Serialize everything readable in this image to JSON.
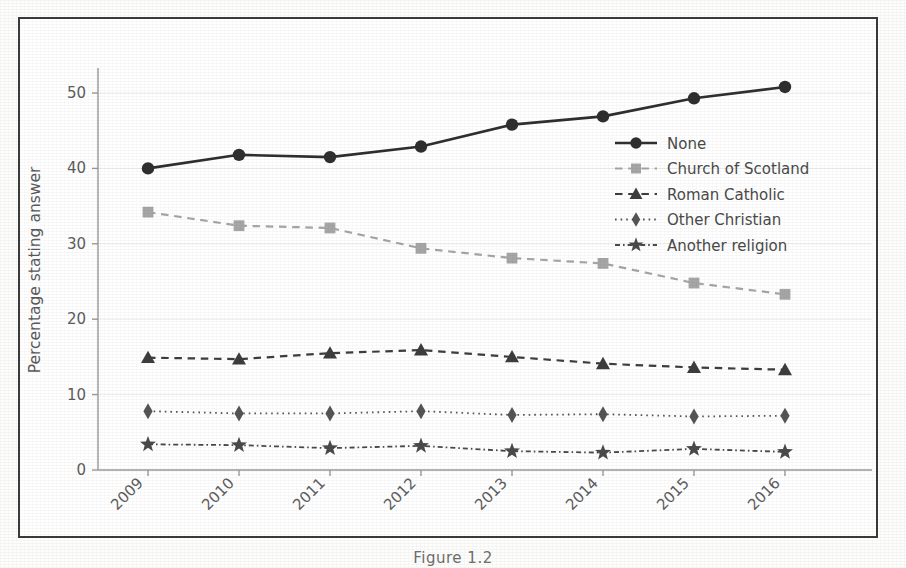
{
  "figure": {
    "caption": "Figure 1.2",
    "frame_color": "#3b3b3b",
    "background": "#ffffff"
  },
  "chart_data": {
    "type": "line",
    "title": "",
    "subtitle": "",
    "xlabel": "",
    "ylabel": "Percentage stating answer",
    "categories": [
      "2009",
      "2010",
      "2011",
      "2012",
      "2013",
      "2014",
      "2015",
      "2016"
    ],
    "x_tick_labels": [
      "2009",
      "2010",
      "2011",
      "2012",
      "2013",
      "2014",
      "2015",
      "2016"
    ],
    "x_tick_rotation": 45,
    "y_tick_labels": [
      "0",
      "10",
      "20",
      "30",
      "40",
      "50"
    ],
    "y_ticks": [
      0,
      10,
      20,
      30,
      40,
      50
    ],
    "ylim": [
      0,
      54
    ],
    "grid": "horizontal",
    "legend_position": "center-right",
    "series": [
      {
        "name": "None",
        "values": [
          40.0,
          41.8,
          41.5,
          42.9,
          45.8,
          46.9,
          49.3,
          50.8
        ],
        "color": "#2f2f2f",
        "marker": "circle",
        "linestyle": "solid",
        "linewidth": 2.6
      },
      {
        "name": "Church of Scotland",
        "values": [
          34.2,
          32.4,
          32.1,
          29.4,
          28.1,
          27.4,
          24.8,
          23.3
        ],
        "color": "#a6a6a6",
        "marker": "square",
        "linestyle": "dashed",
        "linewidth": 2.2
      },
      {
        "name": "Roman Catholic",
        "values": [
          14.9,
          14.7,
          15.5,
          15.9,
          15.0,
          14.1,
          13.6,
          13.3
        ],
        "color": "#3d3d3d",
        "marker": "triangle",
        "linestyle": "dashed",
        "linewidth": 2.2
      },
      {
        "name": "Other Christian",
        "values": [
          7.8,
          7.5,
          7.5,
          7.8,
          7.3,
          7.4,
          7.1,
          7.2
        ],
        "color": "#555555",
        "marker": "diamond",
        "linestyle": "dotted",
        "linewidth": 1.8
      },
      {
        "name": "Another religion",
        "values": [
          3.4,
          3.3,
          2.9,
          3.2,
          2.5,
          2.3,
          2.8,
          2.4
        ],
        "color": "#4a4a4a",
        "marker": "star",
        "linestyle": "dashdot",
        "linewidth": 1.8
      }
    ]
  },
  "legend": {
    "entries": [
      {
        "label": "None"
      },
      {
        "label": "Church of Scotland"
      },
      {
        "label": "Roman Catholic"
      },
      {
        "label": "Other Christian"
      },
      {
        "label": "Another religion"
      }
    ]
  }
}
